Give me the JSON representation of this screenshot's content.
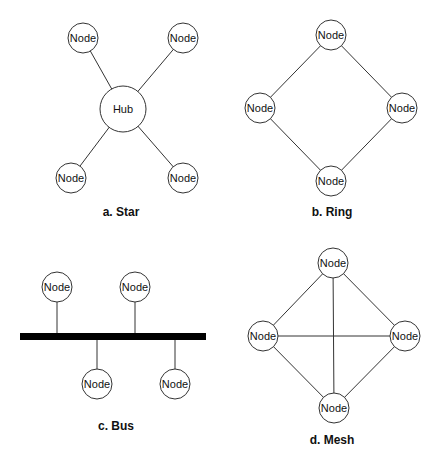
{
  "diagrams": {
    "star": {
      "caption": "a. Star",
      "hub": {
        "label": "Hub",
        "x": 123,
        "y": 109,
        "r": 23
      },
      "nodes": [
        {
          "label": "Node",
          "x": 83,
          "y": 38
        },
        {
          "label": "Node",
          "x": 183,
          "y": 38
        },
        {
          "label": "Node",
          "x": 71,
          "y": 178
        },
        {
          "label": "Node",
          "x": 183,
          "y": 178
        }
      ],
      "caption_pos": {
        "x": 121,
        "y": 212
      }
    },
    "ring": {
      "caption": "b. Ring",
      "nodes": [
        {
          "label": "Node",
          "x": 331,
          "y": 35
        },
        {
          "label": "Node",
          "x": 402,
          "y": 108
        },
        {
          "label": "Node",
          "x": 331,
          "y": 181
        },
        {
          "label": "Node",
          "x": 260,
          "y": 108
        }
      ],
      "caption_pos": {
        "x": 332,
        "y": 212
      }
    },
    "bus": {
      "caption": "c. Bus",
      "bar": {
        "x1": 20,
        "x2": 206,
        "y": 333,
        "h": 7
      },
      "nodes": [
        {
          "label": "Node",
          "x": 57,
          "y": 287
        },
        {
          "label": "Node",
          "x": 135,
          "y": 287
        },
        {
          "label": "Node",
          "x": 97,
          "y": 384
        },
        {
          "label": "Node",
          "x": 175,
          "y": 384
        }
      ],
      "caption_pos": {
        "x": 116,
        "y": 426
      }
    },
    "mesh": {
      "caption": "d. Mesh",
      "nodes": [
        {
          "label": "Node",
          "x": 333,
          "y": 263
        },
        {
          "label": "Node",
          "x": 405,
          "y": 336
        },
        {
          "label": "Node",
          "x": 334,
          "y": 408
        },
        {
          "label": "Node",
          "x": 263,
          "y": 336
        }
      ],
      "caption_pos": {
        "x": 332,
        "y": 440
      }
    }
  },
  "node_radius": 15
}
